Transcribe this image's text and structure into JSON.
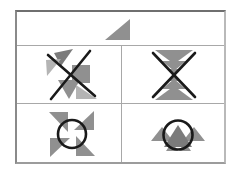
{
  "palette": {
    "background": "#ffffff",
    "border": "#8a8a8a",
    "grid_line": "#a8a8a8",
    "shape_gray": "#909090",
    "shape_gray_light": "#b4b4b4",
    "shape_gray_dark": "#7b7b7b",
    "mark_black": "#1a1a1a"
  },
  "figure": {
    "kind": "triangle-arrangement puzzle grid",
    "rows": 3,
    "columns_row2_row3": 2,
    "cells": [
      {
        "id": "sample",
        "label": "single gray right triangle sample",
        "shapes": [
          {
            "type": "polygon",
            "name": "sample-right-triangle",
            "points": "88,28 113,28 113,7",
            "fill": "shape_gray"
          }
        ]
      },
      {
        "id": "crossed-cluster",
        "label": "scattered triangle cluster marked with black X",
        "shapes": [
          {
            "type": "polygon",
            "name": "gray-triangle",
            "points": "37,7 56,3 44,20",
            "fill": "shape_gray_dark"
          },
          {
            "type": "polygon",
            "name": "gray-triangle-light",
            "points": "29,14 44,13 30,30",
            "fill": "shape_gray_light"
          },
          {
            "type": "polygon",
            "name": "gray-square",
            "points": "55,19 73,19 73,37 55,37",
            "fill": "shape_gray"
          },
          {
            "type": "polygon",
            "name": "gray-triangle",
            "points": "41,34 63,34 52,53",
            "fill": "shape_gray"
          },
          {
            "type": "polygon",
            "name": "gray-triangle-light",
            "points": "59,39 80,53 59,53",
            "fill": "shape_gray_light"
          },
          {
            "type": "line",
            "name": "cross-mark-stroke",
            "x1": 31,
            "y1": 9,
            "x2": 78,
            "y2": 50,
            "stroke": "mark_black",
            "width": 2.6
          },
          {
            "type": "line",
            "name": "cross-mark-stroke",
            "x1": 73,
            "y1": 5,
            "x2": 34,
            "y2": 53,
            "stroke": "mark_black",
            "width": 2.6
          }
        ]
      },
      {
        "id": "crossed-stack",
        "label": "vertical hourglass stack of triangles marked with black X",
        "shapes": [
          {
            "type": "polygon",
            "name": "gray-triangle-down-large",
            "points": "33,4 71,4 52,18",
            "fill": "shape_gray"
          },
          {
            "type": "polygon",
            "name": "gray-triangle-down-medium",
            "points": "40,15 64,15 52,25",
            "fill": "shape_gray"
          },
          {
            "type": "polygon",
            "name": "gray-triangle-down-small",
            "points": "46,23 58,23 52,30",
            "fill": "shape_gray"
          },
          {
            "type": "polygon",
            "name": "gray-triangle-up-small",
            "points": "46,35 58,35 52,28",
            "fill": "shape_gray"
          },
          {
            "type": "polygon",
            "name": "gray-triangle-up-medium",
            "points": "40,43 64,43 52,33",
            "fill": "shape_gray"
          },
          {
            "type": "polygon",
            "name": "gray-triangle-up-large",
            "points": "33,54 71,54 52,40",
            "fill": "shape_gray"
          },
          {
            "type": "line",
            "name": "cross-mark-stroke",
            "x1": 31,
            "y1": 7,
            "x2": 73,
            "y2": 51,
            "stroke": "mark_black",
            "width": 2.6
          },
          {
            "type": "line",
            "name": "cross-mark-stroke",
            "x1": 73,
            "y1": 7,
            "x2": 31,
            "y2": 51,
            "stroke": "mark_black",
            "width": 2.6
          }
        ]
      },
      {
        "id": "circled-pinwheel",
        "label": "four-blade triangle pinwheel with black circle on center",
        "shapes": [
          {
            "type": "polygon",
            "name": "pinwheel-blade-top",
            "points": "57,26 77,7 77,26",
            "fill": "shape_gray"
          },
          {
            "type": "polygon",
            "name": "pinwheel-blade-right",
            "points": "59,32 78,52 59,52",
            "fill": "shape_gray"
          },
          {
            "type": "polygon",
            "name": "pinwheel-blade-bottom",
            "points": "53,34 33,53 33,34",
            "fill": "shape_gray"
          },
          {
            "type": "polygon",
            "name": "pinwheel-blade-left",
            "points": "51,28 32,8 51,8",
            "fill": "shape_gray"
          },
          {
            "type": "circle",
            "name": "circle-mark",
            "cx": 55,
            "cy": 30,
            "r": 14,
            "stroke": "mark_black",
            "width": 2.6
          }
        ]
      },
      {
        "id": "circled-row",
        "label": "row of up-pointing triangles with black circle on center triangle",
        "shapes": [
          {
            "type": "polygon",
            "name": "gray-triangle-left",
            "points": "29,37 51,37 40,23",
            "fill": "shape_gray"
          },
          {
            "type": "polygon",
            "name": "gray-triangle-right",
            "points": "61,37 83,37 72,23",
            "fill": "shape_gray"
          },
          {
            "type": "polygon",
            "name": "gray-triangle-small-left",
            "points": "44,47 56,47 50,38",
            "fill": "shape_gray"
          },
          {
            "type": "polygon",
            "name": "gray-triangle-small-right",
            "points": "57,47 69,47 63,38",
            "fill": "shape_gray"
          },
          {
            "type": "polygon",
            "name": "gray-triangle-center",
            "points": "42,43 70,43 56,21",
            "fill": "shape_gray_dark"
          },
          {
            "type": "circle",
            "name": "circle-mark",
            "cx": 56,
            "cy": 31,
            "r": 14.5,
            "stroke": "mark_black",
            "width": 2.6
          }
        ]
      }
    ]
  }
}
